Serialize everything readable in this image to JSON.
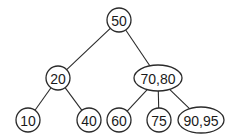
{
  "diagram": {
    "type": "tree",
    "colors": {
      "stroke": "#2a2a2a",
      "text": "#1a1a1a",
      "background": "#ffffff"
    },
    "nodes": [
      {
        "id": "n50",
        "label": "50",
        "keys": [
          50
        ],
        "shape": "circle",
        "cx": 119,
        "cy": 20,
        "rx": 12,
        "ry": 12
      },
      {
        "id": "n20",
        "label": "20",
        "keys": [
          20
        ],
        "shape": "circle",
        "cx": 58,
        "cy": 78,
        "rx": 12,
        "ry": 12
      },
      {
        "id": "n7080",
        "label": "70,80",
        "keys": [
          70,
          80
        ],
        "shape": "ellipse",
        "cx": 158,
        "cy": 78,
        "rx": 24,
        "ry": 13
      },
      {
        "id": "n10",
        "label": "10",
        "keys": [
          10
        ],
        "shape": "circle",
        "cx": 28,
        "cy": 120,
        "rx": 12,
        "ry": 12
      },
      {
        "id": "n40",
        "label": "40",
        "keys": [
          40
        ],
        "shape": "circle",
        "cx": 89,
        "cy": 120,
        "rx": 12,
        "ry": 12
      },
      {
        "id": "n60",
        "label": "60",
        "keys": [
          60
        ],
        "shape": "circle",
        "cx": 119,
        "cy": 120,
        "rx": 12,
        "ry": 12
      },
      {
        "id": "n75",
        "label": "75",
        "keys": [
          75
        ],
        "shape": "circle",
        "cx": 159,
        "cy": 120,
        "rx": 12,
        "ry": 12
      },
      {
        "id": "n9095",
        "label": "90,95",
        "keys": [
          90,
          95
        ],
        "shape": "ellipse",
        "cx": 201,
        "cy": 120,
        "rx": 23,
        "ry": 13
      }
    ],
    "edges": [
      {
        "from": "n50",
        "to": "n20"
      },
      {
        "from": "n50",
        "to": "n7080"
      },
      {
        "from": "n20",
        "to": "n10"
      },
      {
        "from": "n20",
        "to": "n40"
      },
      {
        "from": "n7080",
        "to": "n60"
      },
      {
        "from": "n7080",
        "to": "n75"
      },
      {
        "from": "n7080",
        "to": "n9095"
      }
    ]
  }
}
